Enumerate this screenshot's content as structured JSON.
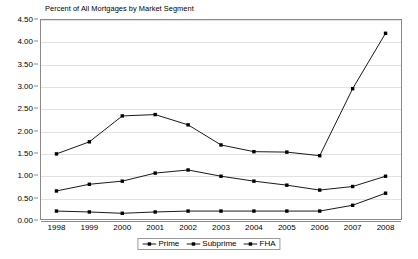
{
  "chart_data": {
    "type": "line",
    "title": "Percent of All Mortgages by Market Segment",
    "xlabel": "",
    "ylabel": "",
    "categories": [
      "1998",
      "1999",
      "2000",
      "2001",
      "2002",
      "2003",
      "2004",
      "2005",
      "2006",
      "2007",
      "2008"
    ],
    "ylim": [
      0.0,
      4.5
    ],
    "ytick_step": 0.5,
    "yticks": [
      "4.50",
      "4.00",
      "3.50",
      "3.00",
      "2.50",
      "2.00",
      "1.50",
      "1.00",
      "0.50",
      "0.00"
    ],
    "grid": true,
    "legend_position": "bottom-center",
    "marker": "square",
    "series": [
      {
        "name": "Prime",
        "color": "#000000",
        "values": [
          0.65,
          0.8,
          0.87,
          1.05,
          1.12,
          0.98,
          0.87,
          0.78,
          0.67,
          0.75,
          0.98
        ]
      },
      {
        "name": "Subprime",
        "color": "#000000",
        "values": [
          1.48,
          1.75,
          2.33,
          2.36,
          2.13,
          1.68,
          1.53,
          1.52,
          1.44,
          0.4,
          0.6
        ]
      },
      {
        "name": "FHA",
        "color": "#000000",
        "values": [
          0.2,
          0.18,
          0.15,
          0.18,
          0.2,
          0.2,
          0.2,
          0.2,
          0.2,
          0.33,
          0.6
        ]
      }
    ],
    "plotted_lines": [
      {
        "name": "top-line",
        "values": [
          1.48,
          1.75,
          2.33,
          2.36,
          2.13,
          1.68,
          1.53,
          1.52,
          1.44,
          2.94,
          4.18
        ]
      },
      {
        "name": "middle-line",
        "values": [
          0.65,
          0.8,
          0.87,
          1.05,
          1.12,
          0.98,
          0.87,
          0.78,
          0.67,
          0.75,
          0.98
        ]
      },
      {
        "name": "bottom-line",
        "values": [
          0.2,
          0.18,
          0.15,
          0.18,
          0.2,
          0.2,
          0.2,
          0.2,
          0.2,
          0.33,
          0.6
        ]
      }
    ]
  },
  "legend": {
    "items": [
      {
        "label": "Prime",
        "key": "line-marker-square"
      },
      {
        "label": "Subprime",
        "key": "line-marker-square"
      },
      {
        "label": "FHA",
        "key": "line-marker-square"
      }
    ]
  }
}
